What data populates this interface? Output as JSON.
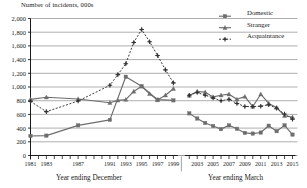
{
  "chart_data": {
    "type": "line",
    "title": "",
    "ylabel": "Number of incidents, 000s",
    "xlabel_left": "Year ending December",
    "xlabel_right": "Year ending March",
    "ylim": [
      0,
      2000
    ],
    "ytick_step": 200,
    "ytick_labels": [
      "0",
      "200",
      "400",
      "600",
      "800",
      "1,000",
      "1,200",
      "1,400",
      "1,600",
      "1,800",
      "2,000"
    ],
    "grid": true,
    "legend_position": "top-right",
    "axis_break_after": 1999,
    "x": [
      1981,
      1982,
      1983,
      1984,
      1985,
      1986,
      1987,
      1988,
      1989,
      1990,
      1991,
      1992,
      1993,
      1994,
      1995,
      1996,
      1997,
      1998,
      1999,
      2000,
      2002,
      2003,
      2004,
      2005,
      2006,
      2007,
      2008,
      2009,
      2010,
      2011,
      2012,
      2013,
      2014,
      2015
    ],
    "xtick_labels": [
      "1981",
      "",
      "1983",
      "",
      "",
      "",
      "1987",
      "",
      "",
      "",
      "1991",
      "",
      "1993",
      "",
      "1995",
      "",
      "1997",
      "",
      "1999",
      "",
      "",
      "2003",
      "",
      "2005",
      "",
      "2007",
      "",
      "2009",
      "",
      "2011",
      "",
      "2013",
      "",
      "2015"
    ],
    "series": [
      {
        "name": "Domestic",
        "marker": "square",
        "line": "solid",
        "color": "#6d6d6d",
        "values": [
          285,
          null,
          290,
          null,
          null,
          null,
          440,
          null,
          null,
          null,
          520,
          null,
          1150,
          null,
          1010,
          null,
          815,
          null,
          805,
          null,
          615,
          540,
          475,
          430,
          385,
          440,
          390,
          330,
          320,
          335,
          435,
          355,
          440,
          305
        ]
      },
      {
        "name": "Stranger",
        "marker": "triangle",
        "line": "solid",
        "color": "#6d6d6d",
        "values": [
          820,
          null,
          850,
          null,
          null,
          null,
          825,
          null,
          null,
          null,
          770,
          805,
          815,
          935,
          1010,
          900,
          810,
          880,
          975,
          null,
          875,
          935,
          925,
          855,
          880,
          895,
          820,
          860,
          715,
          895,
          760,
          700,
          580,
          560
        ]
      },
      {
        "name": "Acquaintance",
        "marker": "cross",
        "line": "dashed",
        "color": "#333333",
        "values": [
          790,
          null,
          640,
          null,
          null,
          null,
          795,
          null,
          null,
          null,
          1025,
          1180,
          1340,
          1650,
          1840,
          1660,
          1460,
          1250,
          1060,
          null,
          880,
          920,
          880,
          840,
          800,
          820,
          760,
          715,
          715,
          720,
          740,
          690,
          605,
          530
        ]
      }
    ]
  },
  "legend": {
    "items": [
      {
        "label": "Domestic"
      },
      {
        "label": "Stranger"
      },
      {
        "label": "Acquaintance"
      }
    ]
  }
}
